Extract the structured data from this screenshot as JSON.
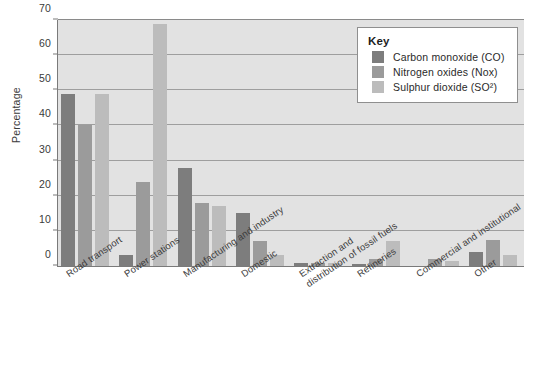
{
  "chart_data": {
    "type": "bar",
    "title": "",
    "xlabel": "",
    "ylabel": "Percentage",
    "ylim": [
      0,
      70
    ],
    "yticks": [
      0,
      10,
      20,
      30,
      40,
      50,
      60,
      70
    ],
    "grid": true,
    "legend_position": "top-right",
    "categories": [
      "Road transport",
      "Power stations",
      "Manufacturing and industry",
      "Domestic",
      "Extraction and\ndistribution of fossil fuels",
      "Refineries",
      "Commercial and institutional",
      "Other"
    ],
    "series": [
      {
        "name": "Carbon monoxide (CO)",
        "color": "#7d7d7d",
        "values": [
          49,
          3,
          28,
          15,
          1,
          0.5,
          0,
          4
        ]
      },
      {
        "name": "Nitrogen oxides (Nox)",
        "color": "#9b9b9b",
        "values": [
          40,
          24,
          18,
          7,
          1,
          2,
          2,
          7.5
        ]
      },
      {
        "name": "Sulphur dioxide (SO²)",
        "color": "#bcbcbc",
        "values": [
          49,
          69,
          17,
          3,
          1,
          7,
          1.5,
          3
        ]
      }
    ]
  },
  "legend": {
    "title": "Key"
  },
  "axis": {
    "y_title": "Percentage"
  }
}
